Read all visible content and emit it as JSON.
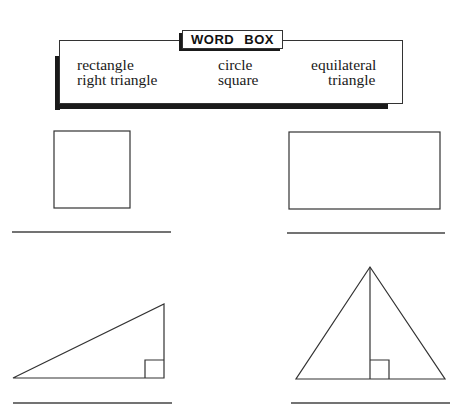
{
  "word_box": {
    "title": "WORD BOX",
    "words": [
      {
        "text": "rectangle",
        "x": 77,
        "y": 58
      },
      {
        "text": "right triangle",
        "x": 77,
        "y": 73
      },
      {
        "text": "circle",
        "x": 218,
        "y": 58
      },
      {
        "text": "square",
        "x": 218,
        "y": 73
      },
      {
        "text": "equilateral",
        "x": 311,
        "y": 58
      },
      {
        "text": "triangle",
        "x": 328,
        "y": 73
      }
    ]
  },
  "shapes": [
    {
      "name": "square",
      "type": "square"
    },
    {
      "name": "rectangle",
      "type": "rectangle"
    },
    {
      "name": "right-triangle",
      "type": "right triangle"
    },
    {
      "name": "equilateral-triangle",
      "type": "equilateral triangle"
    }
  ],
  "answer_lines": [
    {
      "for": "square",
      "value": ""
    },
    {
      "for": "rectangle",
      "value": ""
    },
    {
      "for": "right-triangle",
      "value": ""
    },
    {
      "for": "equilateral-triangle",
      "value": ""
    }
  ],
  "colors": {
    "ink": "#333333",
    "shadow": "#1a1a1a",
    "background": "#ffffff"
  }
}
